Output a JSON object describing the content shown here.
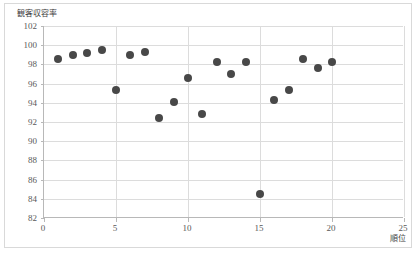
{
  "chart_data": {
    "type": "scatter",
    "title": "",
    "xlabel": "順位",
    "ylabel": "観客収容率",
    "xlim": [
      0,
      25
    ],
    "ylim": [
      82,
      102
    ],
    "xticks": [
      0,
      5,
      10,
      15,
      20,
      25
    ],
    "yticks": [
      82,
      84,
      86,
      88,
      90,
      92,
      94,
      96,
      98,
      100,
      102
    ],
    "grid": "horizontal-and-vertical",
    "legend": "none",
    "marker_color": "#484848",
    "series": [
      {
        "name": "観客収容率",
        "points": [
          {
            "x": 1,
            "y": 98.6
          },
          {
            "x": 2,
            "y": 99.0
          },
          {
            "x": 3,
            "y": 99.2
          },
          {
            "x": 4,
            "y": 99.5
          },
          {
            "x": 5,
            "y": 95.3
          },
          {
            "x": 6,
            "y": 99.0
          },
          {
            "x": 7,
            "y": 99.3
          },
          {
            "x": 8,
            "y": 92.4
          },
          {
            "x": 9,
            "y": 94.1
          },
          {
            "x": 10,
            "y": 96.6
          },
          {
            "x": 11,
            "y": 92.8
          },
          {
            "x": 12,
            "y": 98.2
          },
          {
            "x": 13,
            "y": 97.0
          },
          {
            "x": 14,
            "y": 98.2
          },
          {
            "x": 15,
            "y": 84.5
          },
          {
            "x": 16,
            "y": 94.3
          },
          {
            "x": 17,
            "y": 95.3
          },
          {
            "x": 18,
            "y": 98.6
          },
          {
            "x": 19,
            "y": 97.6
          },
          {
            "x": 20,
            "y": 98.2
          }
        ]
      }
    ]
  },
  "colors": {
    "marker": "#484848",
    "gridline": "#dcdcdc",
    "axis": "#b8b8b8",
    "frame_border": "#d9d9d9",
    "tick_text": "#595959",
    "title_text": "#404040"
  }
}
